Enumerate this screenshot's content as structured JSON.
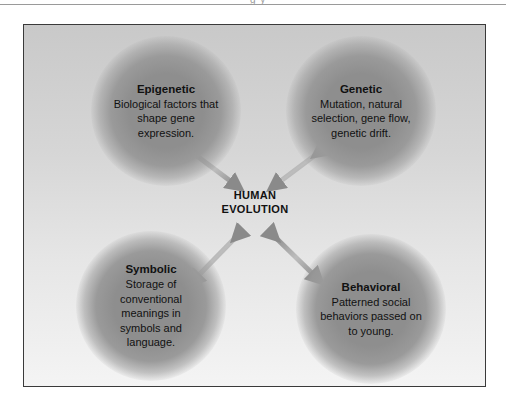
{
  "page": {
    "top_clipped_text": "g   y"
  },
  "diagram": {
    "center": {
      "line1": "HUMAN",
      "line2": "EVOLUTION"
    },
    "nodes": [
      {
        "id": "epigenetic",
        "title": "Epigenetic",
        "description": "Biological factors that shape gene expression.",
        "position": "top-left"
      },
      {
        "id": "genetic",
        "title": "Genetic",
        "description": "Mutation, natural selection, gene flow, genetic drift.",
        "position": "top-right"
      },
      {
        "id": "symbolic",
        "title": "Symbolic",
        "description": "Storage of conventional meanings in symbols and language.",
        "position": "bottom-left"
      },
      {
        "id": "behavioral",
        "title": "Behavioral",
        "description": "Patterned social behaviors passed on to young.",
        "position": "bottom-right"
      }
    ],
    "edges": [
      {
        "from": "center",
        "to": "epigenetic",
        "type": "double-arrow"
      },
      {
        "from": "center",
        "to": "genetic",
        "type": "double-arrow"
      },
      {
        "from": "center",
        "to": "symbolic",
        "type": "double-arrow"
      },
      {
        "from": "center",
        "to": "behavioral",
        "type": "double-arrow"
      }
    ],
    "colors": {
      "frame_border": "#3a3a3a",
      "background_top": "#c9c9c9",
      "background_bottom": "#f4f4f4",
      "node_fill": "#8e8e8e",
      "arrow": "#8a8a8a",
      "text": "#111111"
    }
  }
}
